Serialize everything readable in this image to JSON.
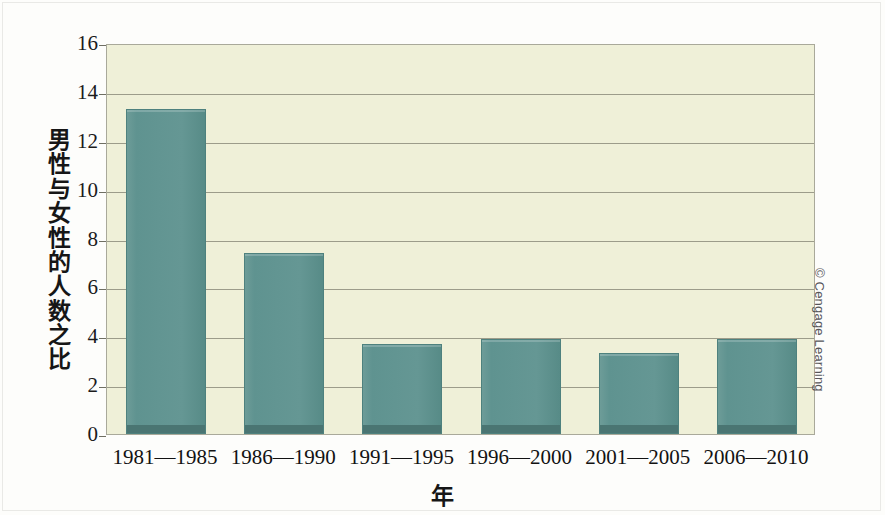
{
  "figure": {
    "credit": "© Cengage Learning",
    "background_color": "#fdfdfb",
    "plot_background_color": "#eff0d8",
    "bar_color": "#5f9390",
    "bar_base_color": "#4a7572",
    "gridline_color": "#8d8d7d",
    "axis_color": "#a9a99a"
  },
  "chart_data": {
    "type": "bar",
    "title": "",
    "subtitle": "",
    "xlabel": "年",
    "ylabel": "男性与女性的人数之比",
    "categories": [
      "1981—1985",
      "1986—1990",
      "1991—1995",
      "1996—2000",
      "2001—2005",
      "2006—2010"
    ],
    "values": [
      13.3,
      7.4,
      3.7,
      3.9,
      3.3,
      3.9
    ],
    "ylim": [
      0,
      16
    ],
    "ytick_labels": [
      "0",
      "2",
      "4",
      "6",
      "8",
      "10",
      "12",
      "14",
      "16"
    ],
    "ytick_values": [
      0,
      2,
      4,
      6,
      8,
      10,
      12,
      14,
      16
    ],
    "grid": true,
    "grid_axis": "y",
    "legend": false,
    "legend_position": "none",
    "annotations": [
      "© Cengage Learning"
    ],
    "series": [
      {
        "name": "男性与女性的人数之比",
        "values": [
          13.3,
          7.4,
          3.7,
          3.9,
          3.3,
          3.9
        ]
      }
    ]
  }
}
